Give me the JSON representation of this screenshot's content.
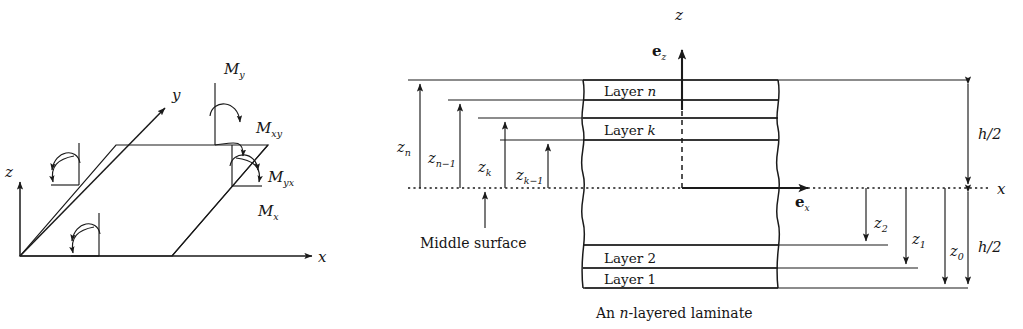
{
  "figure": {
    "background": "#ffffff",
    "ink": "#1a1a1a",
    "panels": [
      "moment-resultants-plate",
      "n-layered-laminate"
    ]
  },
  "left_panel": {
    "name": "plate-moment-resultants",
    "axes": [
      {
        "id": "z",
        "label": "z",
        "direction": "up"
      },
      {
        "id": "y",
        "label": "y",
        "direction": "diagonal-up-right"
      },
      {
        "id": "x",
        "label": "x",
        "direction": "right"
      }
    ],
    "moments": [
      {
        "id": "My",
        "base": "M",
        "sub": "y"
      },
      {
        "id": "Mxy",
        "base": "M",
        "sub": "xy"
      },
      {
        "id": "Myx",
        "base": "M",
        "sub": "yx"
      },
      {
        "id": "Mx",
        "base": "M",
        "sub": "x"
      }
    ]
  },
  "right_panel": {
    "name": "laminate-cross-section",
    "caption_parts": [
      "An ",
      "n",
      "-layered laminate"
    ],
    "caption_text": "An n-layered laminate",
    "axes": [
      {
        "id": "z",
        "label": "z",
        "direction": "up"
      },
      {
        "id": "x",
        "label": "x",
        "direction": "right"
      }
    ],
    "basis_vectors": [
      {
        "id": "ez",
        "base": "e",
        "sub": "z"
      },
      {
        "id": "ex",
        "base": "e",
        "sub": "x"
      }
    ],
    "middle_surface_label": "Middle surface",
    "layers": [
      {
        "id": "layer-n",
        "prefix": "Layer ",
        "name": "n",
        "italic_name": true
      },
      {
        "id": "layer-k",
        "prefix": "Layer ",
        "name": "k",
        "italic_name": true
      },
      {
        "id": "layer-2",
        "prefix": "Layer ",
        "name": "2",
        "italic_name": false
      },
      {
        "id": "layer-1",
        "prefix": "Layer ",
        "name": "1",
        "italic_name": false
      }
    ],
    "z_coordinates_above": [
      {
        "id": "zn",
        "base": "z",
        "sub": "n"
      },
      {
        "id": "zn-1",
        "base": "z",
        "sub": "n−1"
      },
      {
        "id": "zk",
        "base": "z",
        "sub": "k"
      },
      {
        "id": "zk-1",
        "base": "z",
        "sub": "k−1"
      }
    ],
    "z_coordinates_below": [
      {
        "id": "z2",
        "base": "z",
        "sub": "2"
      },
      {
        "id": "z1",
        "base": "z",
        "sub": "1"
      },
      {
        "id": "z0",
        "base": "z",
        "sub": "0"
      }
    ],
    "thickness_labels": [
      {
        "id": "h-over-2-upper",
        "text": "h/2"
      },
      {
        "id": "h-over-2-lower",
        "text": "h/2"
      }
    ]
  }
}
